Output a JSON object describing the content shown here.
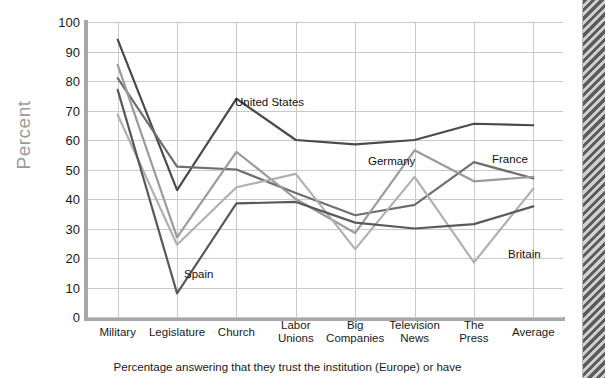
{
  "top_cropped_text": "",
  "axes": {
    "ylabel": "Percent",
    "yticks": [
      "100",
      "90",
      "80",
      "70",
      "60",
      "50",
      "40",
      "30",
      "20",
      "10",
      "0"
    ],
    "xticks": [
      "Military",
      "Legislature",
      "Church",
      "Labor\nUnions",
      "Big\nCompanies",
      "Television\nNews",
      "The\nPress",
      "Average"
    ]
  },
  "caption": "Percentage answering that they trust the institution (Europe) or have",
  "series_labels": {
    "united_states": "United States",
    "spain": "Spain",
    "germany": "Germany",
    "france": "France",
    "britain": "Britain"
  },
  "colors": {
    "united_states": "#4a4a4a",
    "spain": "#595959",
    "germany": "#9b9b9b",
    "france": "#6e6e6e",
    "britain": "#b0b0b0",
    "gridline": "#c9c9c9",
    "axis": "#a8a8a8",
    "ylabel": "#9a9a9a",
    "text": "#1a1a1a"
  },
  "chart_data": {
    "type": "line",
    "title": "",
    "xlabel": "",
    "ylabel": "Percent",
    "ylim": [
      0,
      100
    ],
    "grid": true,
    "legend_position": "inline-annotations",
    "categories": [
      "Military",
      "Legislature",
      "Church",
      "Labor Unions",
      "Big Companies",
      "Television News",
      "The Press",
      "Average"
    ],
    "series": [
      {
        "name": "United States",
        "color": "#4a4a4a",
        "values": [
          94,
          43,
          74,
          60,
          58.5,
          60,
          65.5,
          65
        ]
      },
      {
        "name": "France",
        "color": "#6e6e6e",
        "values": [
          81,
          51,
          50,
          42,
          34.5,
          38,
          52.5,
          47
        ]
      },
      {
        "name": "Germany",
        "color": "#9b9b9b",
        "values": [
          85.5,
          27,
          56,
          40,
          28.5,
          56.5,
          46,
          47.5
        ]
      },
      {
        "name": "Britain",
        "color": "#b0b0b0",
        "values": [
          68.5,
          24.5,
          44,
          48.5,
          23,
          47.5,
          18.5,
          43.5
        ]
      },
      {
        "name": "Spain",
        "color": "#595959",
        "values": [
          77,
          8,
          38.5,
          39,
          32,
          30,
          31.5,
          37.5
        ]
      }
    ]
  },
  "annotations": [
    {
      "text": "United States",
      "x": 235,
      "y": 96
    },
    {
      "text": "Spain",
      "x": 184,
      "y": 268
    },
    {
      "text": "Germany",
      "x": 368,
      "y": 155
    },
    {
      "text": "France",
      "x": 492,
      "y": 153
    },
    {
      "text": "Britain",
      "x": 508,
      "y": 248
    }
  ]
}
